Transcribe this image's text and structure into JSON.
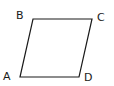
{
  "diagram": {
    "type": "parallelogram",
    "stroke_color": "#1a1a1a",
    "vertices": [
      {
        "label": "A",
        "x": 20,
        "y": 77,
        "label_x": 3,
        "label_y": 80
      },
      {
        "label": "B",
        "x": 33,
        "y": 19,
        "label_x": 16,
        "label_y": 19
      },
      {
        "label": "C",
        "x": 92,
        "y": 19,
        "label_x": 97,
        "label_y": 21
      },
      {
        "label": "D",
        "x": 79,
        "y": 77,
        "label_x": 84,
        "label_y": 81
      }
    ]
  }
}
